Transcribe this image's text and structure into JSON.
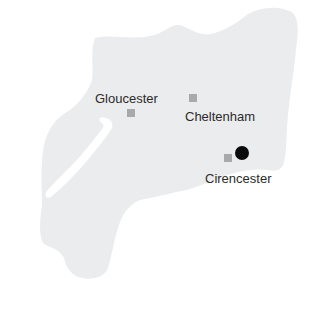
{
  "map": {
    "region_fill": "#ebecee",
    "river_fill": "#ffffff",
    "towns": [
      {
        "name": "Gloucester",
        "marker": "square",
        "marker_color": "#a9a9ab"
      },
      {
        "name": "Cheltenham",
        "marker": "square",
        "marker_color": "#a9a9ab"
      },
      {
        "name": "Cirencester",
        "marker": "square",
        "marker_color": "#a9a9ab"
      }
    ],
    "highlight": {
      "marker": "dot",
      "color": "#0a0a0a",
      "near": "Cirencester"
    }
  }
}
